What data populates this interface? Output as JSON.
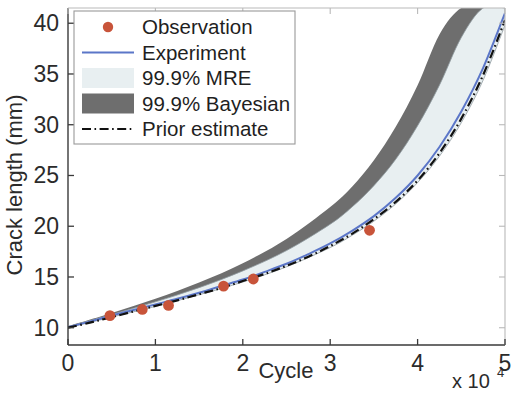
{
  "chart_data": {
    "type": "line",
    "title": "",
    "xlabel": "Cycle",
    "ylabel": "Crack length (mm)",
    "x_multiplier": "x 10",
    "x_multiplier_exponent": "4",
    "xlim": [
      0,
      5
    ],
    "ylim": [
      8.3,
      41.5
    ],
    "xticks": [
      0,
      1,
      2,
      3,
      4,
      5
    ],
    "xticklabels": [
      "0",
      "1",
      "2",
      "3",
      "4",
      "5"
    ],
    "yticks": [
      10,
      15,
      20,
      25,
      30,
      35,
      40
    ],
    "yticklabels": [
      "10",
      "15",
      "20",
      "25",
      "30",
      "35",
      "40"
    ],
    "grid": false,
    "legend_position": "top-left",
    "colors": {
      "observation": "#c8543a",
      "experiment": "#5b76c8",
      "mre_band": "#e8eff1",
      "bayesian_band": "#6e6e6e",
      "prior_estimate": "#111111",
      "axis": "#3a3a3a"
    },
    "series": [
      {
        "name": "Observation",
        "type": "scatter",
        "x": [
          0.48,
          0.85,
          1.15,
          1.78,
          2.12,
          3.45
        ],
        "y": [
          11.2,
          11.8,
          12.2,
          14.1,
          14.8,
          19.6
        ]
      },
      {
        "name": "Experiment",
        "type": "line",
        "x": [
          0,
          0.25,
          0.5,
          0.75,
          1.0,
          1.25,
          1.5,
          1.75,
          2.0,
          2.25,
          2.5,
          2.75,
          3.0,
          3.25,
          3.5,
          3.75,
          4.0,
          4.25,
          4.5,
          4.75,
          5.0
        ],
        "y": [
          10.05,
          10.6,
          11.2,
          11.75,
          12.3,
          12.85,
          13.45,
          14.1,
          14.75,
          15.5,
          16.3,
          17.25,
          18.3,
          19.55,
          21.0,
          22.8,
          25.0,
          27.8,
          31.3,
          35.6,
          41.0
        ]
      },
      {
        "name": "Prior estimate",
        "type": "line-dashdot",
        "x": [
          0,
          0.25,
          0.5,
          0.75,
          1.0,
          1.25,
          1.5,
          1.75,
          2.0,
          2.25,
          2.5,
          2.75,
          3.0,
          3.25,
          3.5,
          3.75,
          4.0,
          4.25,
          4.5,
          4.75,
          5.0
        ],
        "y": [
          10.0,
          10.5,
          11.05,
          11.6,
          12.15,
          12.7,
          13.3,
          13.9,
          14.6,
          15.3,
          16.1,
          17.0,
          18.05,
          19.25,
          20.7,
          22.4,
          24.5,
          27.2,
          30.6,
          34.9,
          40.3
        ]
      },
      {
        "name": "99.9% MRE",
        "type": "band",
        "x": [
          0,
          0.5,
          1.0,
          1.5,
          2.0,
          2.5,
          3.0,
          3.25,
          3.5,
          3.75,
          4.0,
          4.25,
          4.5,
          4.75,
          5.0
        ],
        "y_lower": [
          10.0,
          11.05,
          12.1,
          13.25,
          14.5,
          16.0,
          17.9,
          19.1,
          20.5,
          22.2,
          24.3,
          26.9,
          30.2,
          34.4,
          39.8
        ],
        "y_upper": [
          10.1,
          11.3,
          12.55,
          13.95,
          15.6,
          17.6,
          20.2,
          21.9,
          24.0,
          26.6,
          29.9,
          33.9,
          38.6,
          41.5,
          41.5
        ]
      },
      {
        "name": "99.9% Bayesian",
        "type": "band",
        "x": [
          0,
          0.5,
          1.0,
          1.5,
          2.0,
          2.5,
          3.0,
          3.25,
          3.5,
          3.75,
          4.0,
          4.25,
          4.5,
          4.75,
          5.0
        ],
        "y_lower": [
          10.0,
          11.1,
          12.2,
          13.4,
          14.75,
          16.35,
          18.35,
          19.6,
          21.1,
          22.9,
          25.1,
          27.9,
          31.4,
          35.8,
          41.3
        ],
        "y_upper": [
          10.15,
          11.45,
          12.85,
          14.45,
          16.35,
          18.75,
          21.9,
          23.9,
          26.5,
          29.8,
          33.9,
          38.9,
          41.5,
          41.5,
          41.5
        ]
      }
    ],
    "legend": [
      {
        "label": "Observation",
        "marker": "dot",
        "color": "#c8543a"
      },
      {
        "label": "Experiment",
        "marker": "line",
        "color": "#5b76c8"
      },
      {
        "label": "99.9% MRE",
        "marker": "patch",
        "color": "#e8eff1"
      },
      {
        "label": "99.9% Bayesian",
        "marker": "patch",
        "color": "#6e6e6e"
      },
      {
        "label": "Prior estimate",
        "marker": "dashdot",
        "color": "#111111"
      }
    ]
  }
}
